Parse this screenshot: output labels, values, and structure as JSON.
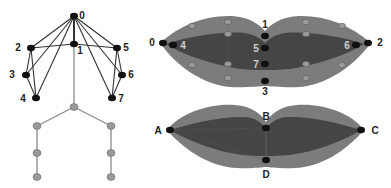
{
  "colors": {
    "background": "#ffffff",
    "outer_lip": "#7c7c7c",
    "inner_lip": "#454545",
    "black_node": "#111111",
    "gray_node": "#9a9a9a",
    "dark_edge": "#333333",
    "gray_edge": "#8a8a8a",
    "label_dark": "#222222",
    "label_light": "#d0d0d0"
  },
  "skeleton": {
    "upper_nodes": [
      {
        "id": "0",
        "label": "0",
        "x": 74,
        "y": 16,
        "lx": 82,
        "ly": 16
      },
      {
        "id": "1",
        "label": "1",
        "x": 74,
        "y": 44,
        "lx": 80,
        "ly": 51
      },
      {
        "id": "2",
        "label": "2",
        "x": 31,
        "y": 48,
        "lx": 18,
        "ly": 48
      },
      {
        "id": "3",
        "label": "3",
        "x": 26,
        "y": 75,
        "lx": 12,
        "ly": 75
      },
      {
        "id": "4",
        "label": "4",
        "x": 36,
        "y": 98,
        "lx": 23,
        "ly": 99
      },
      {
        "id": "5",
        "label": "5",
        "x": 117,
        "y": 48,
        "lx": 126,
        "ly": 48
      },
      {
        "id": "6",
        "label": "6",
        "x": 122,
        "y": 75,
        "lx": 131,
        "ly": 75
      },
      {
        "id": "7",
        "label": "7",
        "x": 112,
        "y": 98,
        "lx": 121,
        "ly": 99
      }
    ],
    "lower_nodes": [
      {
        "id": "hip",
        "x": 74,
        "y": 107
      },
      {
        "id": "l-hip",
        "x": 37,
        "y": 126
      },
      {
        "id": "r-hip",
        "x": 111,
        "y": 126
      },
      {
        "id": "l-knee",
        "x": 37,
        "y": 153
      },
      {
        "id": "r-knee",
        "x": 111,
        "y": 153
      },
      {
        "id": "l-foot",
        "x": 37,
        "y": 177
      },
      {
        "id": "r-foot",
        "x": 111,
        "y": 177
      }
    ],
    "dark_edges": [
      [
        "0",
        "1"
      ],
      [
        "0",
        "2"
      ],
      [
        "0",
        "3"
      ],
      [
        "0",
        "4"
      ],
      [
        "0",
        "5"
      ],
      [
        "0",
        "6"
      ],
      [
        "0",
        "7"
      ],
      [
        "2",
        "1"
      ],
      [
        "1",
        "5"
      ],
      [
        "2",
        "3"
      ],
      [
        "2",
        "4"
      ],
      [
        "3",
        "4"
      ],
      [
        "5",
        "6"
      ],
      [
        "5",
        "7"
      ],
      [
        "6",
        "7"
      ]
    ],
    "gray_edges": [
      [
        "1",
        "hip"
      ],
      [
        "hip",
        "l-hip"
      ],
      [
        "hip",
        "r-hip"
      ],
      [
        "l-hip",
        "l-knee"
      ],
      [
        "l-knee",
        "l-foot"
      ],
      [
        "r-hip",
        "r-knee"
      ],
      [
        "r-knee",
        "r-foot"
      ]
    ]
  },
  "top_lip": {
    "black_points": [
      {
        "id": "0",
        "label": "0",
        "x": 163,
        "y": 43,
        "lx": 152,
        "ly": 43,
        "light": false
      },
      {
        "id": "4",
        "label": "4",
        "x": 173,
        "y": 45,
        "lx": 183,
        "ly": 46,
        "light": true
      },
      {
        "id": "1",
        "label": "1",
        "x": 265,
        "y": 36,
        "lx": 265,
        "ly": 25,
        "light": false
      },
      {
        "id": "5",
        "label": "5",
        "x": 265,
        "y": 48,
        "lx": 256,
        "ly": 49,
        "light": true
      },
      {
        "id": "7",
        "label": "7",
        "x": 265,
        "y": 64,
        "lx": 256,
        "ly": 65,
        "light": true
      },
      {
        "id": "3",
        "label": "3",
        "x": 265,
        "y": 81,
        "lx": 265,
        "ly": 92,
        "light": false
      },
      {
        "id": "6",
        "label": "6",
        "x": 356,
        "y": 45,
        "lx": 347,
        "ly": 46,
        "light": true
      },
      {
        "id": "2",
        "label": "2",
        "x": 368,
        "y": 43,
        "lx": 380,
        "ly": 43,
        "light": false
      }
    ],
    "gray_points": [
      {
        "x": 192,
        "y": 26
      },
      {
        "x": 228,
        "y": 22
      },
      {
        "x": 228,
        "y": 34
      },
      {
        "x": 192,
        "y": 65
      },
      {
        "x": 228,
        "y": 64
      },
      {
        "x": 228,
        "y": 78
      },
      {
        "x": 306,
        "y": 22
      },
      {
        "x": 342,
        "y": 26
      },
      {
        "x": 306,
        "y": 34
      },
      {
        "x": 306,
        "y": 64
      },
      {
        "x": 342,
        "y": 65
      },
      {
        "x": 306,
        "y": 78
      }
    ]
  },
  "bottom_lip": {
    "points": [
      {
        "id": "A",
        "label": "A",
        "x": 170,
        "y": 130,
        "lx": 158,
        "ly": 131
      },
      {
        "id": "B",
        "label": "B",
        "x": 266,
        "y": 128,
        "lx": 266,
        "ly": 117
      },
      {
        "id": "C",
        "label": "C",
        "x": 361,
        "y": 130,
        "lx": 375,
        "ly": 131
      },
      {
        "id": "D",
        "label": "D",
        "x": 266,
        "y": 160,
        "lx": 266,
        "ly": 175
      }
    ]
  }
}
